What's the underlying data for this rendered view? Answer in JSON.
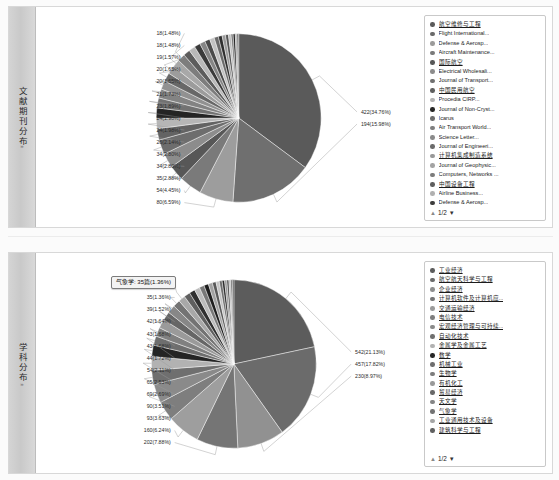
{
  "panels": [
    {
      "id": "journal",
      "side_tab_label": "文献期刊分布",
      "side_tab_caret": "»",
      "legend": {
        "pager": {
          "up_icon": "▲",
          "label": "1/2",
          "down_icon": "▼"
        },
        "items": [
          {
            "label": "航空维修与工程",
            "color": "#5a5a5a",
            "linked": true
          },
          {
            "label": "Flight International...",
            "color": "#6a6a6a",
            "linked": false
          },
          {
            "label": "Defense & Aerosp...",
            "color": "#9b9b9b",
            "linked": false
          },
          {
            "label": "Aircraft Maintenance...",
            "color": "#7a7a7a",
            "linked": false
          },
          {
            "label": "国际航空",
            "color": "#575757",
            "linked": true
          },
          {
            "label": "Electrical Wholesali...",
            "color": "#8c8c8c",
            "linked": false
          },
          {
            "label": "Journal of Transport...",
            "color": "#707070",
            "linked": false
          },
          {
            "label": "中国民用航空",
            "color": "#606060",
            "linked": true
          },
          {
            "label": "Procedia CIRP...",
            "color": "#b4b4b4",
            "linked": false
          },
          {
            "label": "Journal of Non-Cryst...",
            "color": "#262626",
            "linked": false
          },
          {
            "label": "Icarus",
            "color": "#6e6e6e",
            "linked": false
          },
          {
            "label": "Air Transport World...",
            "color": "#7f7f7f",
            "linked": false
          },
          {
            "label": "Science Letter...",
            "color": "#8a8a8a",
            "linked": false
          },
          {
            "label": "Journal of Engineeri...",
            "color": "#6b6b6b",
            "linked": false
          },
          {
            "label": "计算机集成制造系统",
            "color": "#999999",
            "linked": true
          },
          {
            "label": "Journal of Geophysic...",
            "color": "#a3a3a3",
            "linked": false
          },
          {
            "label": "Computers, Networks ...",
            "color": "#7c7c7c",
            "linked": false
          },
          {
            "label": "中国设备工程",
            "color": "#5e5e5e",
            "linked": true
          },
          {
            "label": "Airline Business...",
            "color": "#b0b0b0",
            "linked": false
          },
          {
            "label": "Defense & Aerosp...",
            "color": "#3d3d3d",
            "linked": false
          }
        ]
      },
      "chart_data": {
        "type": "pie",
        "title": "文献期刊分布",
        "unit": "篇",
        "total": 1215,
        "label_format": "count(percent)",
        "slices": [
          {
            "name": "航空维修与工程",
            "value": 422,
            "percent": 34.76,
            "label": "422(34.76%)",
            "color": "#5a5a5a"
          },
          {
            "name": "Flight International...",
            "value": 194,
            "percent": 15.98,
            "label": "194(15.98%)",
            "color": "#6f6f6f"
          },
          {
            "name": "Defense & Aerosp...",
            "value": 80,
            "percent": 6.59,
            "label": "80(6.59%)",
            "color": "#9d9d9d"
          },
          {
            "name": "Aircraft Maintenance...",
            "value": 54,
            "percent": 4.45,
            "label": "54(4.45%)",
            "color": "#7a7a7a"
          },
          {
            "name": "国际航空",
            "value": 35,
            "percent": 2.88,
            "label": "35(2.88%)",
            "color": "#575757"
          },
          {
            "name": "Electrical Wholesali...",
            "value": 34,
            "percent": 2.8,
            "label": "34(2.80%)",
            "color": "#8c8c8c"
          },
          {
            "name": "Journal of Transport...",
            "value": 34,
            "percent": 2.8,
            "label": "34(2.80%)",
            "color": "#6d6d6d"
          },
          {
            "name": "中国民用航空",
            "value": 26,
            "percent": 2.14,
            "label": "26(2.14%)",
            "color": "#636363"
          },
          {
            "name": "Procedia CIRP...",
            "value": 24,
            "percent": 1.98,
            "label": "24(1.98%)",
            "color": "#b6b6b6"
          },
          {
            "name": "Journal of Non-Cryst...",
            "value": 24,
            "percent": 1.98,
            "label": "24(1.98%)",
            "color": "#242424"
          },
          {
            "name": "Icarus",
            "value": 23,
            "percent": 1.89,
            "label": "23(1.89%)",
            "color": "#727272"
          },
          {
            "name": "Air Transport World...",
            "value": 21,
            "percent": 1.73,
            "label": "21(1.73%)",
            "color": "#838383"
          },
          {
            "name": "Science Letter...",
            "value": 20,
            "percent": 1.65,
            "label": "20(1.65%)",
            "color": "#919191"
          },
          {
            "name": "Journal of Engineeri...",
            "value": 20,
            "percent": 1.65,
            "label": "20(1.65%)",
            "color": "#686868"
          },
          {
            "name": "计算机集成制造系统",
            "value": 19,
            "percent": 1.57,
            "label": "19(1.57%)",
            "color": "#9c9c9c"
          },
          {
            "name": "Journal of Geophysic...",
            "value": 18,
            "percent": 1.48,
            "label": "18(1.48%)",
            "color": "#a8a8a8"
          },
          {
            "name": "Computers, Networks ...",
            "value": 18,
            "percent": 1.48,
            "label": "18(1.48%)",
            "color": "#7d7d7d"
          },
          {
            "name": "中国设备工程",
            "value": 16,
            "percent": 1.32,
            "label": "",
            "color": "#5c5c5c"
          },
          {
            "name": "Airline Business...",
            "value": 15,
            "percent": 1.23,
            "label": "",
            "color": "#b9b9b9"
          },
          {
            "name": "Defense & Aerosp...",
            "value": 14,
            "percent": 1.15,
            "label": "",
            "color": "#3a3a3a"
          },
          {
            "name": "其他",
            "value": 13,
            "percent": 1.07,
            "label": "",
            "color": "#868686"
          },
          {
            "name": "其他2",
            "value": 12,
            "percent": 0.99,
            "label": "",
            "color": "#4a4a4a"
          },
          {
            "name": "其他3",
            "value": 11,
            "percent": 0.91,
            "label": "",
            "color": "#c2c2c2"
          },
          {
            "name": "其他4",
            "value": 10,
            "percent": 0.82,
            "label": "",
            "color": "#6a6a6a"
          },
          {
            "name": "其他5",
            "value": 9,
            "percent": 0.74,
            "label": "",
            "color": "#2e2e2e"
          },
          {
            "name": "其他6",
            "value": 8,
            "percent": 0.66,
            "label": "",
            "color": "#9a9a9a"
          },
          {
            "name": "其他7",
            "value": 7,
            "percent": 0.58,
            "label": "",
            "color": "#555555"
          },
          {
            "name": "其他8",
            "value": 6,
            "percent": 0.49,
            "label": "",
            "color": "#bdbdbd"
          },
          {
            "name": "其他9",
            "value": 5,
            "percent": 0.41,
            "label": "",
            "color": "#767676"
          },
          {
            "name": "其他10",
            "value": 5,
            "percent": 0.41,
            "label": "",
            "color": "#1f1f1f"
          },
          {
            "name": "其他11",
            "value": 4,
            "percent": 0.33,
            "label": "",
            "color": "#a0a0a0"
          },
          {
            "name": "其他12",
            "value": 4,
            "percent": 0.33,
            "label": "",
            "color": "#646464"
          }
        ]
      }
    },
    {
      "id": "subject",
      "side_tab_label": "学科分布",
      "side_tab_caret": "»",
      "tooltip": {
        "text": "气象学: 35篇(1.36%)"
      },
      "legend": {
        "pager": {
          "up_icon": "▲",
          "label": "1/2",
          "down_icon": "▼"
        },
        "items": [
          {
            "label": "工业经济",
            "color": "#5c5c5c",
            "linked": true
          },
          {
            "label": "航空航天科学与工程",
            "color": "#6b6b6b",
            "linked": true
          },
          {
            "label": "企业经济",
            "color": "#8e8e8e",
            "linked": true
          },
          {
            "label": "计算机软件及计算机应...",
            "color": "#757575",
            "linked": true
          },
          {
            "label": "交通运输经济",
            "color": "#9b9b9b",
            "linked": true
          },
          {
            "label": "电信技术",
            "color": "#7e7e7e",
            "linked": true
          },
          {
            "label": "宏观经济管理与可持续...",
            "color": "#8a8a8a",
            "linked": true
          },
          {
            "label": "自动化技术",
            "color": "#6f6f6f",
            "linked": true
          },
          {
            "label": "金属学及金属工艺",
            "color": "#b2b2b2",
            "linked": true
          },
          {
            "label": "数学",
            "color": "#262626",
            "linked": true
          },
          {
            "label": "机械工业",
            "color": "#6e6e6e",
            "linked": true
          },
          {
            "label": "生物学",
            "color": "#7c7c7c",
            "linked": true
          },
          {
            "label": "有机化工",
            "color": "#999999",
            "linked": true
          },
          {
            "label": "贸易经济",
            "color": "#686868",
            "linked": true
          },
          {
            "label": "天文学",
            "color": "#858585",
            "linked": true
          },
          {
            "label": "气象学",
            "color": "#737373",
            "linked": true
          },
          {
            "label": "工业通用技术及设备",
            "color": "#a5a5a5",
            "linked": true
          },
          {
            "label": "建筑科学与工程",
            "color": "#606060",
            "linked": true
          }
        ]
      },
      "chart_data": {
        "type": "pie",
        "title": "学科分布",
        "unit": "篇",
        "total": 2565,
        "label_format": "count(percent)",
        "slices": [
          {
            "name": "工业经济",
            "value": 542,
            "percent": 21.13,
            "label": "542(21.13%)",
            "color": "#5c5c5c"
          },
          {
            "name": "航空航天科学与工程",
            "value": 457,
            "percent": 17.82,
            "label": "457(17.82%)",
            "color": "#6b6b6b"
          },
          {
            "name": "企业经济",
            "value": 230,
            "percent": 8.97,
            "label": "230(8.97%)",
            "color": "#919191"
          },
          {
            "name": "计算机软件及计算机应...",
            "value": 202,
            "percent": 7.88,
            "label": "202(7.88%)",
            "color": "#757575"
          },
          {
            "name": "交通运输经济",
            "value": 160,
            "percent": 6.24,
            "label": "160(6.24%)",
            "color": "#9e9e9e"
          },
          {
            "name": "电信技术",
            "value": 93,
            "percent": 3.63,
            "label": "93(3.63%)",
            "color": "#7e7e7e"
          },
          {
            "name": "宏观经济管理与可持续...",
            "value": 90,
            "percent": 3.51,
            "label": "90(3.51%)",
            "color": "#8a8a8a"
          },
          {
            "name": "自动化技术",
            "value": 69,
            "percent": 2.69,
            "label": "69(2.69%)",
            "color": "#6f6f6f"
          },
          {
            "name": "金属学及金属工艺",
            "value": 65,
            "percent": 2.53,
            "label": "65(2.53%)",
            "color": "#b2b2b2"
          },
          {
            "name": "数学",
            "value": 54,
            "percent": 2.11,
            "label": "54(2.11%)",
            "color": "#242424"
          },
          {
            "name": "机械工业",
            "value": 44,
            "percent": 1.72,
            "label": "44(1.72%)",
            "color": "#6e6e6e"
          },
          {
            "name": "生物学",
            "value": 43,
            "percent": 1.68,
            "label": "43(1.68%)",
            "color": "#808080"
          },
          {
            "name": "有机化工",
            "value": 43,
            "percent": 1.68,
            "label": "43(1.68%)",
            "color": "#9a9a9a"
          },
          {
            "name": "贸易经济",
            "value": 42,
            "percent": 1.64,
            "label": "42(1.64%)",
            "color": "#666666"
          },
          {
            "name": "天文学",
            "value": 39,
            "percent": 1.52,
            "label": "39(1.52%)",
            "color": "#878787"
          },
          {
            "name": "气象学",
            "value": 35,
            "percent": 1.36,
            "label": "35(1.36%)",
            "color": "#737373"
          },
          {
            "name": "工业通用技术及设备",
            "value": 33,
            "percent": 1.29,
            "label": "33(1.29%)",
            "color": "#a8a8a8"
          },
          {
            "name": "建筑科学与工程",
            "value": 30,
            "percent": 1.17,
            "label": "",
            "color": "#5f5f5f"
          },
          {
            "name": "其他1",
            "value": 28,
            "percent": 1.09,
            "label": "",
            "color": "#303030"
          },
          {
            "name": "其他2",
            "value": 26,
            "percent": 1.01,
            "label": "",
            "color": "#bcbcbc"
          },
          {
            "name": "其他3",
            "value": 24,
            "percent": 0.94,
            "label": "",
            "color": "#787878"
          },
          {
            "name": "其他4",
            "value": 22,
            "percent": 0.86,
            "label": "",
            "color": "#1e1e1e"
          },
          {
            "name": "其他5",
            "value": 20,
            "percent": 0.78,
            "label": "",
            "color": "#a2a2a2"
          },
          {
            "name": "其他6",
            "value": 18,
            "percent": 0.7,
            "label": "",
            "color": "#595959"
          },
          {
            "name": "其他7",
            "value": 16,
            "percent": 0.62,
            "label": "",
            "color": "#c4c4c4"
          },
          {
            "name": "其他8",
            "value": 14,
            "percent": 0.55,
            "label": "",
            "color": "#6d6d6d"
          },
          {
            "name": "其他9",
            "value": 12,
            "percent": 0.47,
            "label": "",
            "color": "#2a2a2a"
          },
          {
            "name": "其他10",
            "value": 11,
            "percent": 0.43,
            "label": "",
            "color": "#969696"
          },
          {
            "name": "其他11",
            "value": 10,
            "percent": 0.39,
            "label": "",
            "color": "#4e4e4e"
          },
          {
            "name": "其他12",
            "value": 9,
            "percent": 0.35,
            "label": "",
            "color": "#b6b6b6"
          },
          {
            "name": "其他13",
            "value": 8,
            "percent": 0.31,
            "label": "",
            "color": "#707070"
          },
          {
            "name": "其他14",
            "value": 7,
            "percent": 0.27,
            "label": "",
            "color": "#383838"
          }
        ]
      }
    }
  ]
}
